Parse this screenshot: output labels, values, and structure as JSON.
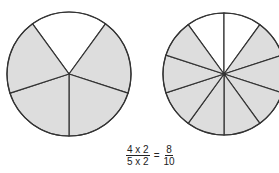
{
  "diagram": {
    "left_circle": {
      "parts": 5,
      "shaded": 4,
      "fill": "#dddddd",
      "stroke": "#333333"
    },
    "right_circle": {
      "parts": 10,
      "shaded": 8,
      "fill": "#dddddd",
      "stroke": "#333333"
    },
    "equation": {
      "left_numerator": "4 x 2",
      "left_denominator": "5 x 2",
      "equals": "=",
      "right_numerator": "8",
      "right_denominator": "10"
    }
  }
}
